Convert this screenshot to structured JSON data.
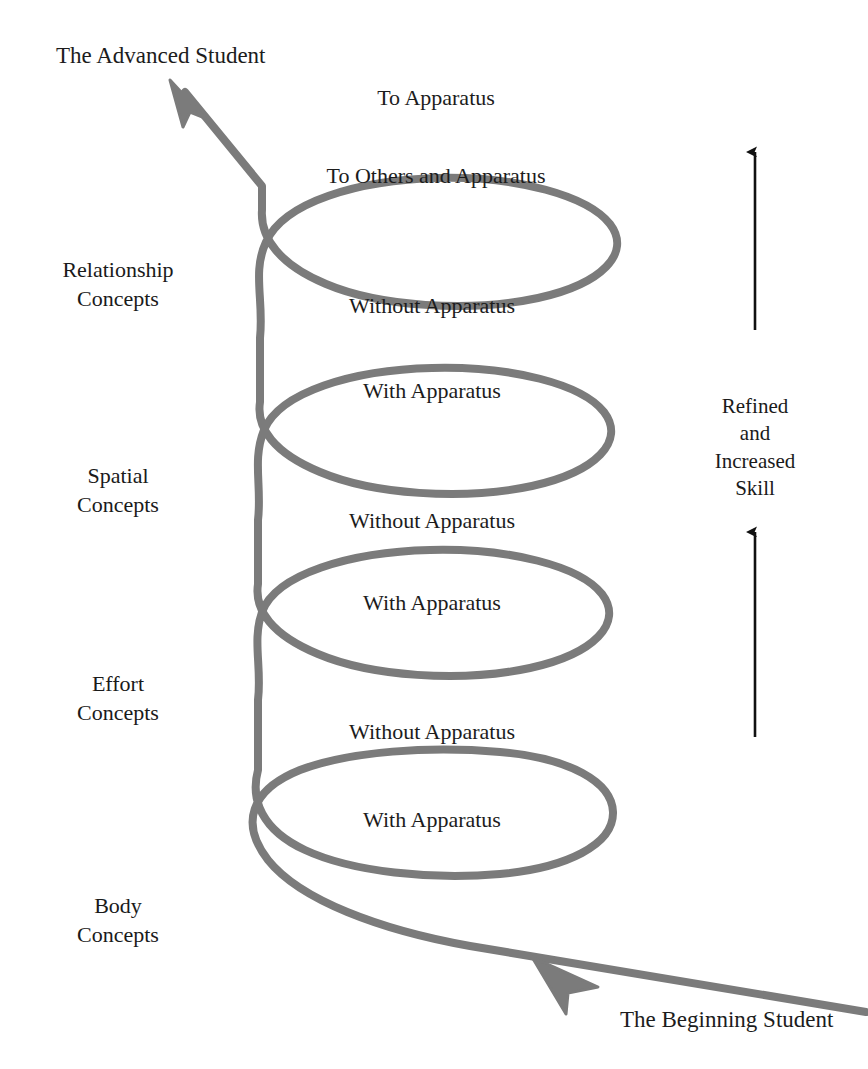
{
  "diagram": {
    "title_top_left": "The Advanced Student",
    "title_bottom_right": "The Beginning Student",
    "spiral_color": "#7b7b7b",
    "arrow_color": "#111111",
    "text_color": "#1c1c1c",
    "background": "#ffffff"
  },
  "stage_labels": [
    {
      "line1": "Relationship",
      "line2": "Concepts"
    },
    {
      "line1": "Spatial",
      "line2": "Concepts"
    },
    {
      "line1": "Effort",
      "line2": "Concepts"
    },
    {
      "line1": "Body",
      "line2": "Concepts"
    }
  ],
  "loops": [
    {
      "outer_label": "To Apparatus",
      "inner_label": "To Others and Apparatus"
    },
    {
      "outer_label": "Without Apparatus",
      "inner_label": "With Apparatus"
    },
    {
      "outer_label": "Without Apparatus",
      "inner_label": "With Apparatus"
    },
    {
      "outer_label": "Without Apparatus",
      "inner_label": "With Apparatus"
    }
  ],
  "skill_axis": {
    "lines": [
      "Refined",
      "and",
      "Increased",
      "Skill"
    ],
    "upper_arrow": "arrow-up-icon",
    "lower_arrow": "arrow-up-icon"
  },
  "icons": {
    "spiral": "spiral-path-icon",
    "advanced_arrow": "arrow-up-left-icon",
    "beginning_arrow": "arrow-up-left-icon"
  }
}
